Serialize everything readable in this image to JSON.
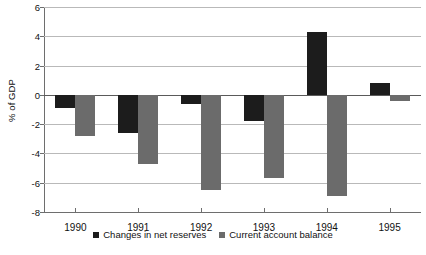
{
  "chart_data": {
    "type": "bar",
    "title": "",
    "xlabel": "",
    "ylabel": "% of GDP",
    "categories": [
      "1990",
      "1991",
      "1992",
      "1993",
      "1994",
      "1995"
    ],
    "series": [
      {
        "name": "Changes in net reserves",
        "color": "#1c1c1c",
        "values": [
          -0.9,
          -2.6,
          -0.6,
          -1.8,
          4.3,
          0.8
        ]
      },
      {
        "name": "Current account balance",
        "color": "#6b6b6b",
        "values": [
          -2.8,
          -4.7,
          -6.5,
          -5.7,
          -6.9,
          -0.4
        ]
      }
    ],
    "ylim": [
      -8,
      6
    ],
    "ytick_values": [
      6,
      4,
      2,
      0,
      -2,
      -4,
      -6,
      -8
    ],
    "ytick_labels": [
      "6",
      "4",
      "2",
      "0",
      "-2",
      "-4",
      "-6",
      "-8"
    ],
    "grid": true,
    "grid_axis": "y",
    "legend_position": "bottom"
  },
  "caption": {
    "partial_text": "clipped text"
  }
}
